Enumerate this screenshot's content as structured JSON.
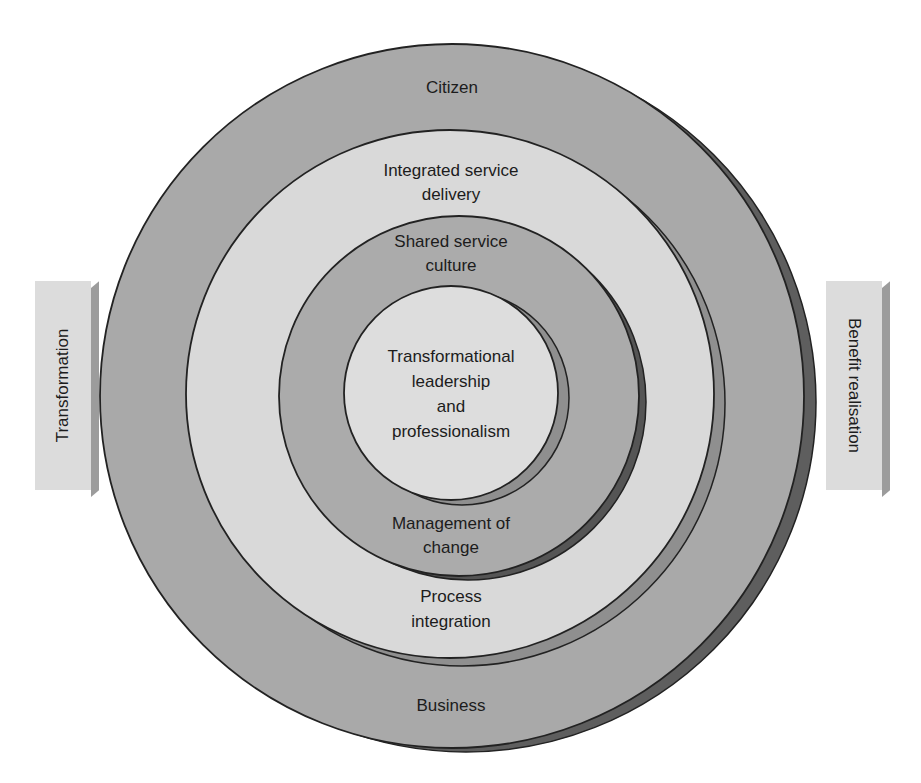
{
  "diagram": {
    "type": "concentric-circles",
    "rings": [
      {
        "id": "outer",
        "labels_top": [
          "Citizen"
        ],
        "labels_bottom": [
          "Business"
        ],
        "fill": "#a9a9a9",
        "shadow": "#5e5e5e"
      },
      {
        "id": "second",
        "labels_top": [
          "Integrated service",
          "delivery"
        ],
        "labels_bottom": [
          "Process",
          "integration"
        ],
        "fill": "#d9d9d9",
        "shadow": "#8f8f8f"
      },
      {
        "id": "third",
        "labels_top": [
          "Shared service",
          "culture"
        ],
        "labels_bottom": [
          "Management of",
          "change"
        ],
        "fill": "#ababab",
        "shadow": "#555555"
      },
      {
        "id": "core",
        "labels_center": [
          "Transformational",
          "leadership",
          "and",
          "professionalism"
        ],
        "fill": "#dddddd",
        "shadow": "#8f8f8f"
      }
    ],
    "side_panels": {
      "left": {
        "label": "Transformation"
      },
      "right": {
        "label": "Benefit realisation"
      }
    },
    "colors": {
      "outline": "#222222",
      "panel_face": "#dcdcdc",
      "panel_edge": "#9c9c9c"
    }
  }
}
